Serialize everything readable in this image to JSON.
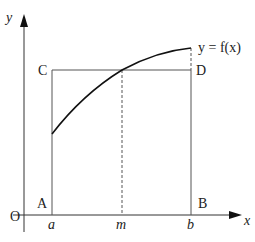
{
  "diagram": {
    "title": "",
    "axes": {
      "x_label": "x",
      "y_label": "y",
      "origin_label": "O"
    },
    "points": {
      "A": "A",
      "B": "B",
      "C": "C",
      "D": "D"
    },
    "x_ticks": {
      "a": "a",
      "m": "m",
      "b": "b"
    },
    "curve_label": "y = f(x)",
    "colors": {
      "line": "#222222",
      "rect": "#555555",
      "dashed": "#555555",
      "background": "#ffffff"
    }
  }
}
